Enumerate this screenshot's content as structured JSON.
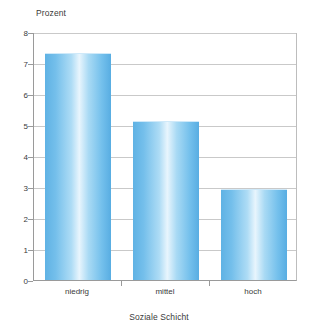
{
  "chart_data": {
    "type": "bar",
    "title": "",
    "subtitle": "",
    "xlabel": "Soziale Schicht",
    "ylabel": "Prozent",
    "categories": [
      "niedrig",
      "mittel",
      "hoch"
    ],
    "values": [
      7.3,
      5.1,
      2.9
    ],
    "series": [
      {
        "name": "Prozent",
        "values": [
          7.3,
          5.1,
          2.9
        ]
      }
    ],
    "ylim": [
      0,
      8
    ],
    "yticks": [
      0,
      1,
      2,
      3,
      4,
      5,
      6,
      7,
      8
    ],
    "ytick_labels": [
      "0",
      "1",
      "2",
      "3",
      "4",
      "5",
      "6",
      "7",
      "8"
    ],
    "grid": "horizontal",
    "legend": "none",
    "bar_color": "#6cbbea",
    "bar_gradient_highlight": "#e8f5fd",
    "gridline_color": "#c9c9c9",
    "axis_color": "#9a9a9a",
    "background_color": "#ffffff",
    "text_color": "#3a3a3a"
  }
}
